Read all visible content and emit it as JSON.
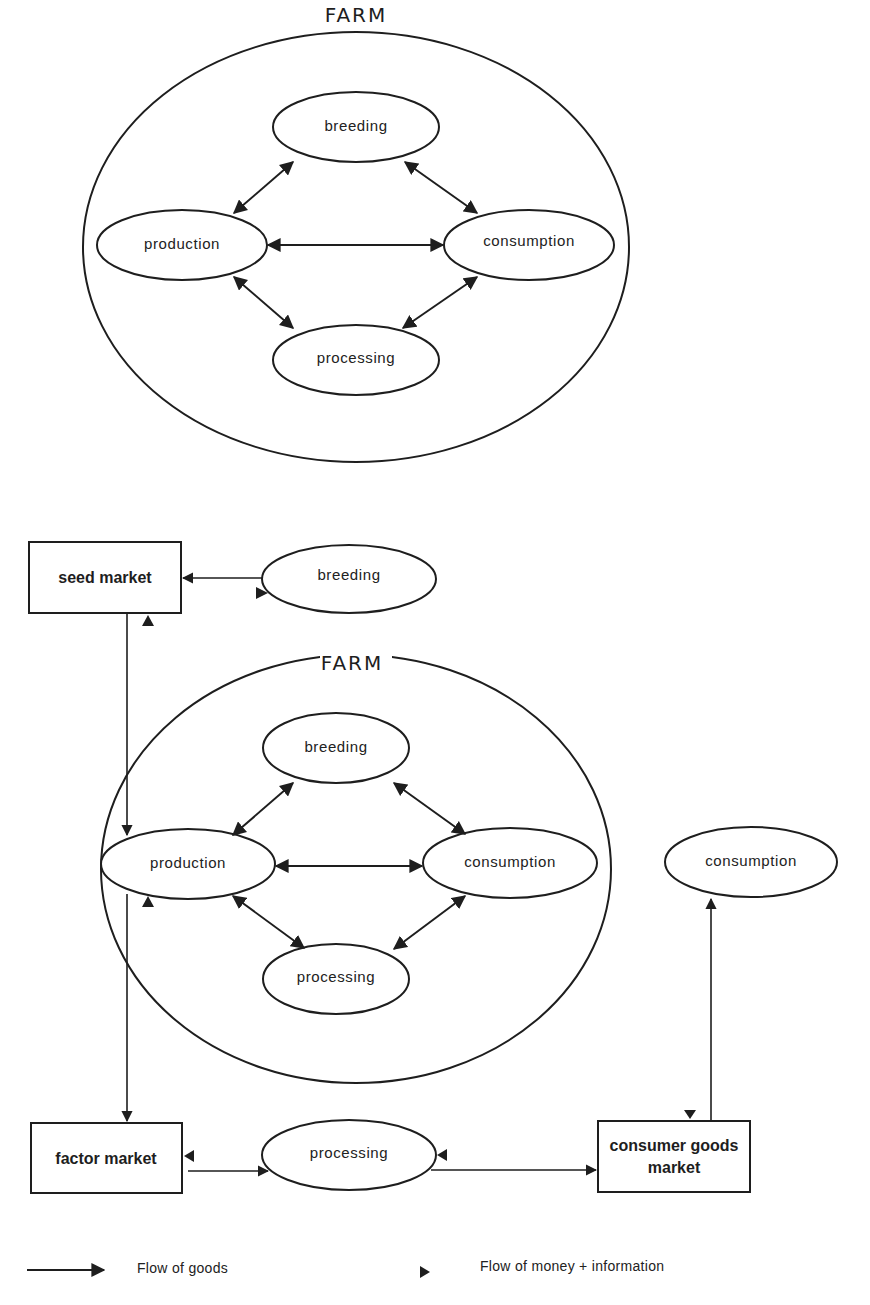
{
  "colors": {
    "ink": "#1e1e1e",
    "background": "#ffffff"
  },
  "top_diagram": {
    "farm_label": "FARM",
    "nodes": {
      "breeding": "breeding",
      "production": "production",
      "consumption": "consumption",
      "processing": "processing"
    },
    "edges": [
      {
        "from": "production",
        "to": "breeding",
        "type": "bidirectional"
      },
      {
        "from": "breeding",
        "to": "consumption",
        "type": "bidirectional"
      },
      {
        "from": "production",
        "to": "consumption",
        "type": "bidirectional"
      },
      {
        "from": "production",
        "to": "processing",
        "type": "bidirectional"
      },
      {
        "from": "processing",
        "to": "consumption",
        "type": "bidirectional"
      }
    ]
  },
  "bottom_diagram": {
    "farm_label": "FARM",
    "inner_nodes": {
      "breeding": "breeding",
      "production": "production",
      "consumption": "consumption",
      "processing": "processing"
    },
    "external": {
      "seed_market": "seed market",
      "breeding": "breeding",
      "factor_market": "factor market",
      "processing": "processing",
      "consumer_goods_market_line1": "consumer goods",
      "consumer_goods_market_line2": "market",
      "consumption": "consumption"
    },
    "goods_flows": [
      {
        "from": "breeding",
        "to": "seed market"
      },
      {
        "from": "seed market",
        "to": "production"
      },
      {
        "from": "production",
        "to": "factor market"
      },
      {
        "from": "factor market",
        "to": "processing"
      },
      {
        "from": "processing",
        "to": "consumer goods market"
      },
      {
        "from": "consumer goods market",
        "to": "consumption"
      }
    ],
    "money_information_flows": [
      {
        "to": "breeding",
        "from": "seed market"
      },
      {
        "to": "seed market",
        "from": "production"
      },
      {
        "to": "production",
        "from": "factor market"
      },
      {
        "to": "factor market",
        "from": "processing"
      },
      {
        "to": "processing",
        "from": "consumer goods market"
      },
      {
        "to": "consumer goods market",
        "from": "consumption"
      }
    ]
  },
  "legend": {
    "goods_label": "Flow of goods",
    "money_label": "Flow of money + information"
  }
}
